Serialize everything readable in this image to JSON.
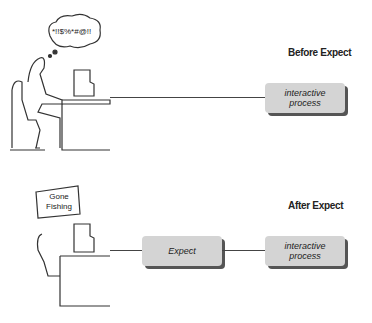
{
  "diagram": {
    "before": {
      "title": "Before Expect",
      "thought_bubble": "*!!$%*#@!!",
      "process_box": "interactive process"
    },
    "after": {
      "title": "After Expect",
      "sign": "Gone Fishing",
      "expect_box": "Expect",
      "process_box": "interactive process"
    }
  }
}
